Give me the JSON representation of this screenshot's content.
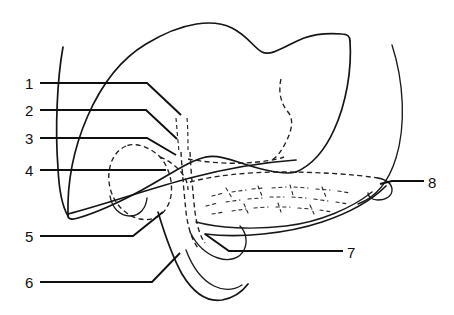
{
  "figure": {
    "kind": "anatomical-line-diagram",
    "background_color": "#ffffff",
    "line_color": "#151515",
    "width": 454,
    "height": 315
  },
  "labels": [
    {
      "id": "1",
      "text": "1",
      "x": 25,
      "y": 76,
      "leader": "M 40 83 L 147 83 L 181 115"
    },
    {
      "id": "2",
      "text": "2",
      "x": 25,
      "y": 103,
      "leader": "M 40 110 L 146 110 L 177 139"
    },
    {
      "id": "3",
      "text": "3",
      "x": 25,
      "y": 131,
      "leader": "M 40 138 L 147 138 L 176 155"
    },
    {
      "id": "4",
      "text": "4",
      "x": 25,
      "y": 163,
      "leader": "M 40 170 L 166 170"
    },
    {
      "id": "5",
      "text": "5",
      "x": 25,
      "y": 229,
      "leader": "M 40 236 L 133 236 L 163 212"
    },
    {
      "id": "6",
      "text": "6",
      "x": 25,
      "y": 275,
      "leader": "M 40 282 L 152 282 L 180 253"
    },
    {
      "id": "7",
      "text": "7",
      "x": 347,
      "y": 245,
      "leader": "M 343 251 L 229 251 L 205 234"
    },
    {
      "id": "8",
      "text": "8",
      "x": 428,
      "y": 175,
      "leader": "M 424 181 L 392 181 L 380 184"
    }
  ],
  "strokes": {
    "liver_superior_border": "M 68 216 C 66 150 96 74 146 44 C 184 21 214 19 232 28 C 248 36 254 48 262 52 C 272 57 288 44 304 38 C 318 33 330 33 342 34 C 348 34 350 37 350 41",
    "liver_right_lobe_edge": "M 350 41 C 352 70 346 104 334 130 C 324 152 310 166 296 172",
    "liver_inferior_right": "M 296 172 C 282 176 256 168 238 162 C 224 157 214 155 206 157",
    "liver_inferior_left": "M 206 157 C 190 160 168 176 142 190 C 116 204 92 214 78 218 C 72 220 68 219 68 216",
    "liver_left_margin": "M 63 47 C 57 80 55 130 58 168 C 59 190 62 206 68 216",
    "liver_notch_dash": "M 281 79 C 278 92 281 104 288 112 C 294 119 292 130 286 142 C 281 152 276 158 272 160",
    "liver_hidden_inferior": "M 188 159 C 204 162 226 164 244 163 C 262 162 276 160 284 157",
    "gallbladder_body": "M 126 146 C 112 152 106 170 110 188 C 114 204 126 216 140 219 C 154 222 166 214 170 200 C 174 186 170 168 160 157 C 150 147 136 142 126 146",
    "gallbladder_fundus": "M 110 196 C 112 208 120 216 130 216 C 140 216 146 208 147 198",
    "cystic_duct": "M 160 157 C 168 160 176 166 181 172 C 186 178 188 184 188 190",
    "hepatic_duct_left": "M 176 118 C 177 130 178 142 179 152",
    "hepatic_duct_right": "M 187 118 C 188 130 188 142 188 152",
    "common_bile_duct": "M 181 152 C 182 170 184 192 186 212 C 188 228 192 240 198 248",
    "common_bile_duct_2": "M 190 152 C 191 172 193 194 195 212 C 197 226 200 236 205 243",
    "pancreas_superior": "M 190 182 C 212 176 246 172 282 172 C 318 172 352 174 378 178",
    "pancreas_inferior": "M 196 222 C 218 228 252 230 286 226 C 320 222 352 208 372 192",
    "pancreas_tail_tip": "M 378 178 C 388 180 392 184 392 190 C 392 196 386 200 378 200 C 372 200 368 197 368 193",
    "pancreas_head_outline": "M 190 232 C 196 244 206 254 218 258 C 230 262 240 258 244 250 C 248 242 246 232 240 226",
    "duodenum_outer": "M 158 212 C 164 232 172 256 182 274 C 194 294 208 302 222 300 C 234 298 242 292 248 284",
    "duodenum_inner": "M 186 250 C 192 266 202 280 214 286 C 224 291 234 290 242 285",
    "stomach_spleen_curve": "M 392 45 C 404 82 406 126 396 158 C 388 184 374 198 358 204",
    "omentum_line_left": "M 68 214 C 106 204 152 188 190 178 C 228 168 268 162 296 160",
    "omentum_line_right": "M 205 234 C 240 238 286 234 322 222 C 352 212 374 198 386 186"
  },
  "texture_paths": {
    "pancreas_lobules": [
      "M 212 196 L 224 193",
      "M 232 192 L 246 190",
      "M 252 189 L 264 188",
      "M 272 188 L 286 187",
      "M 294 187 L 308 188",
      "M 316 189 L 330 190",
      "M 338 191 L 350 193",
      "M 206 206 L 218 203",
      "M 226 202 L 240 200",
      "M 248 199 L 262 198",
      "M 270 197 L 284 197",
      "M 292 197 L 306 198",
      "M 314 199 L 328 201",
      "M 336 202 L 348 204",
      "M 212 214 L 224 212",
      "M 232 211 L 246 209",
      "M 254 208 L 268 207",
      "M 276 207 L 290 207",
      "M 298 208 L 312 209",
      "M 320 210 L 332 212",
      "M 226 188 L 232 198",
      "M 258 186 L 262 196",
      "M 290 185 L 293 195",
      "M 322 187 L 326 197",
      "M 244 204 L 248 213",
      "M 278 203 L 281 212",
      "M 310 205 L 314 214"
    ]
  }
}
